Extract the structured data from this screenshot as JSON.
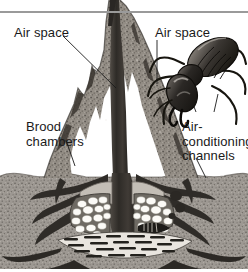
{
  "figure": {
    "background_color": "#ffffff",
    "soil_color": "#9d9892",
    "mound_color": "#8e8880",
    "tunnel_color": "#3a3631",
    "egg_color": "#fdfdfb",
    "rule_color": "#9a9a9a"
  },
  "labels": {
    "air_space_left": "Air space",
    "air_space_right": "Air space",
    "brood_chambers": "Brood\nchambers",
    "air_conditioning_channels": "Air-\nconditioning\nchannels"
  },
  "parts": {
    "mound_spire": "mound-spire",
    "soil_ground": "soil-ground",
    "brood_chamber_left": "brood-chamber-left",
    "brood_chamber_right": "brood-chamber-right",
    "air_channels": "air-conditioning-channels",
    "central_shaft": "central-shaft",
    "termite": "termite-soldier",
    "egg_cluster": "egg-cluster",
    "fungus_combs": "fungus-comb-galleries"
  },
  "leaders": {
    "air_space_left": "leader-line-air-space-left",
    "air_space_right": "leader-line-air-space-right",
    "brood_chambers": "leader-line-brood-chambers",
    "air_conditioning": "leader-line-air-conditioning"
  }
}
